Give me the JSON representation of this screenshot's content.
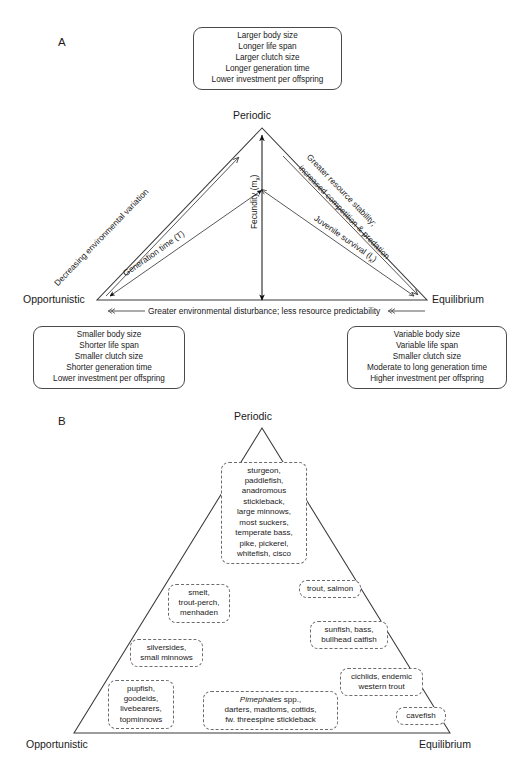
{
  "figure": {
    "panel_a_letter": "A",
    "panel_b_letter": "B"
  },
  "panel_a": {
    "vertices": {
      "top": "Periodic",
      "left": "Opportunistic",
      "right": "Equilibrium"
    },
    "top_box": {
      "lines": [
        "Larger body size",
        "Longer life span",
        "Larger clutch size",
        "Longer generation time",
        "Lower investment per offspring"
      ]
    },
    "left_box": {
      "lines": [
        "Smaller body size",
        "Shorter life span",
        "Smaller clutch size",
        "Shorter generation time",
        "Lower investment per offspring"
      ]
    },
    "right_box": {
      "lines": [
        "Variable body size",
        "Variable life span",
        "Smaller clutch size",
        "Moderate to long generation time",
        "Higher investment per offspring"
      ]
    },
    "axes": {
      "left_outer": "Decreasing environmental variation",
      "right_outer_line1": "Greater resource stability;",
      "right_outer_line2": "increased competition & predation",
      "left_inner": "Generation time (T)",
      "right_inner": "Juvenile survival (l",
      "right_inner_sub": "x",
      "right_inner_tail": ")",
      "vertical": "Fecundity (m",
      "vertical_sub": "x",
      "vertical_tail": ")",
      "base": "Greater environmental disturbance; less resource predictability"
    }
  },
  "panel_b": {
    "vertices": {
      "top": "Periodic",
      "left": "Opportunistic",
      "right": "Equilibrium"
    },
    "taxa": [
      {
        "id": "periodic-core",
        "lines": [
          "sturgeon,",
          "paddlefish,",
          "anadromous",
          "stickleback,",
          "large minnows,",
          "most suckers,",
          "temperate bass,",
          "pike, pickerel,",
          "whitefish, cisco"
        ]
      },
      {
        "id": "smelt-group",
        "lines": [
          "smelt,",
          "trout-perch,",
          "menhaden"
        ]
      },
      {
        "id": "trout-salmon",
        "lines": [
          "trout, salmon"
        ]
      },
      {
        "id": "sunfish-group",
        "lines": [
          "sunfish, bass,",
          "bullhead catfish"
        ]
      },
      {
        "id": "silversides-group",
        "lines": [
          "silversides,",
          "small minnows"
        ]
      },
      {
        "id": "cichlids-group",
        "lines": [
          "cichlids, endemic",
          "western trout"
        ]
      },
      {
        "id": "pupfish-group",
        "lines": [
          "pupfish,",
          "goodeids,",
          "livebearers,",
          "topminnows"
        ]
      },
      {
        "id": "pimephales-group",
        "lines": [
          "Pimephales spp.,",
          "darters, madtoms, cottids,",
          "fw. threespine stickleback"
        ],
        "italic_first_word": "Pimephales"
      },
      {
        "id": "cavefish",
        "lines": [
          "cavefish"
        ]
      }
    ]
  }
}
